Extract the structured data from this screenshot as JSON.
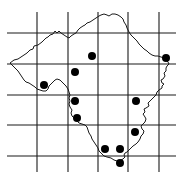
{
  "map": {
    "type": "grid-distribution-map",
    "width": 179,
    "height": 180,
    "colors": {
      "background": "#ffffff",
      "grid": "#1a1a1a",
      "outline": "#1a1a1a",
      "dot": "#000000"
    },
    "grid": {
      "vertical_x": [
        37,
        68,
        98,
        128,
        159
      ],
      "vertical_y_range": [
        12,
        172
      ],
      "horizontal_y": [
        33,
        64,
        95,
        125,
        156
      ],
      "horizontal_x_range": [
        7,
        176
      ]
    },
    "points": [
      {
        "x": 92,
        "y": 56
      },
      {
        "x": 75,
        "y": 72
      },
      {
        "x": 166,
        "y": 58
      },
      {
        "x": 44,
        "y": 85
      },
      {
        "x": 75,
        "y": 101
      },
      {
        "x": 136,
        "y": 101
      },
      {
        "x": 77,
        "y": 118
      },
      {
        "x": 135,
        "y": 132
      },
      {
        "x": 105,
        "y": 149
      },
      {
        "x": 120,
        "y": 149
      },
      {
        "x": 120,
        "y": 163
      }
    ],
    "point_radius": 4
  }
}
